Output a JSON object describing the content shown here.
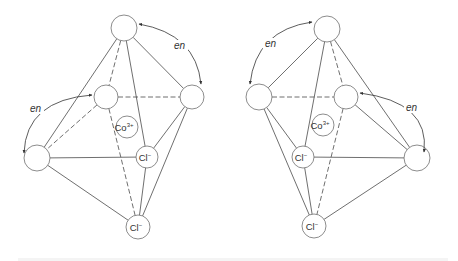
{
  "figure": {
    "colors": {
      "line": "#4a4a4a",
      "circle": "#6e6e6e",
      "text": "#333333",
      "background": "#ffffff"
    },
    "structures": [
      {
        "id": "left-isomer",
        "nodes": [
          {
            "id": "top",
            "x": 124,
            "y": 28,
            "r": 13,
            "label": ""
          },
          {
            "id": "back-left",
            "x": 106,
            "y": 97,
            "r": 12,
            "label": ""
          },
          {
            "id": "right",
            "x": 192,
            "y": 97,
            "r": 12,
            "label": ""
          },
          {
            "id": "left",
            "x": 37,
            "y": 158,
            "r": 13,
            "label": ""
          },
          {
            "id": "co",
            "x": 127,
            "y": 127,
            "r": 11,
            "label": "Co",
            "sup": "3+"
          },
          {
            "id": "cl-mid",
            "x": 147,
            "y": 157,
            "r": 11,
            "label": "Cl",
            "sup": "−"
          },
          {
            "id": "cl-bottom",
            "x": 138,
            "y": 227,
            "r": 12,
            "label": "Cl",
            "sup": "−"
          }
        ],
        "edges": [
          {
            "from": "top",
            "to": "left",
            "style": "solid"
          },
          {
            "from": "top",
            "to": "back-left",
            "style": "dashed"
          },
          {
            "from": "top",
            "to": "cl-mid",
            "style": "solid"
          },
          {
            "from": "top",
            "to": "right",
            "style": "solid"
          },
          {
            "from": "back-left",
            "to": "right",
            "style": "dashed"
          },
          {
            "from": "back-left",
            "to": "left",
            "style": "dashed"
          },
          {
            "from": "back-left",
            "to": "cl-bottom",
            "style": "dashed"
          },
          {
            "from": "left",
            "to": "cl-mid",
            "style": "solid"
          },
          {
            "from": "left",
            "to": "cl-bottom",
            "style": "solid"
          },
          {
            "from": "right",
            "to": "cl-mid",
            "style": "solid"
          },
          {
            "from": "right",
            "to": "cl-bottom",
            "style": "solid"
          },
          {
            "from": "cl-mid",
            "to": "cl-bottom",
            "style": "solid"
          }
        ],
        "ligand_arcs": [
          {
            "label": "en",
            "path": "M 139 24 Q 196 34 201 84",
            "label_x": 174,
            "label_y": 49,
            "marker_start": true,
            "marker_end": true
          },
          {
            "label": "en",
            "path": "M 92 95 Q 26 100 24 153",
            "label_x": 30,
            "label_y": 112,
            "marker_start": true,
            "marker_end": true
          }
        ]
      },
      {
        "id": "right-isomer",
        "nodes": [
          {
            "id": "top",
            "x": 327,
            "y": 29,
            "r": 13,
            "label": ""
          },
          {
            "id": "left",
            "x": 259,
            "y": 97,
            "r": 13,
            "label": ""
          },
          {
            "id": "back-right",
            "x": 346,
            "y": 97,
            "r": 12,
            "label": ""
          },
          {
            "id": "right",
            "x": 417,
            "y": 158,
            "r": 13,
            "label": ""
          },
          {
            "id": "co",
            "x": 323,
            "y": 125,
            "r": 11,
            "label": "Co",
            "sup": "3+"
          },
          {
            "id": "cl-mid",
            "x": 303,
            "y": 157,
            "r": 11,
            "label": "Cl",
            "sup": "−"
          },
          {
            "id": "cl-bottom",
            "x": 314,
            "y": 226,
            "r": 12,
            "label": "Cl",
            "sup": "−"
          }
        ],
        "edges": [
          {
            "from": "top",
            "to": "left",
            "style": "solid"
          },
          {
            "from": "top",
            "to": "back-right",
            "style": "dashed"
          },
          {
            "from": "top",
            "to": "cl-mid",
            "style": "solid"
          },
          {
            "from": "top",
            "to": "right",
            "style": "solid"
          },
          {
            "from": "left",
            "to": "back-right",
            "style": "dashed"
          },
          {
            "from": "left",
            "to": "cl-mid",
            "style": "solid"
          },
          {
            "from": "left",
            "to": "cl-bottom",
            "style": "solid"
          },
          {
            "from": "back-right",
            "to": "right",
            "style": "solid"
          },
          {
            "from": "back-right",
            "to": "cl-bottom",
            "style": "dashed"
          },
          {
            "from": "right",
            "to": "cl-mid",
            "style": "solid"
          },
          {
            "from": "right",
            "to": "cl-bottom",
            "style": "solid"
          },
          {
            "from": "cl-mid",
            "to": "cl-bottom",
            "style": "solid"
          }
        ],
        "ligand_arcs": [
          {
            "label": "en",
            "path": "M 312 22 Q 256 30 250 84",
            "label_x": 265,
            "label_y": 47,
            "marker_start": true,
            "marker_end": true
          },
          {
            "label": "en",
            "path": "M 360 93 Q 430 102 424 152",
            "label_x": 406,
            "label_y": 111,
            "marker_start": true,
            "marker_end": true
          }
        ]
      }
    ]
  }
}
